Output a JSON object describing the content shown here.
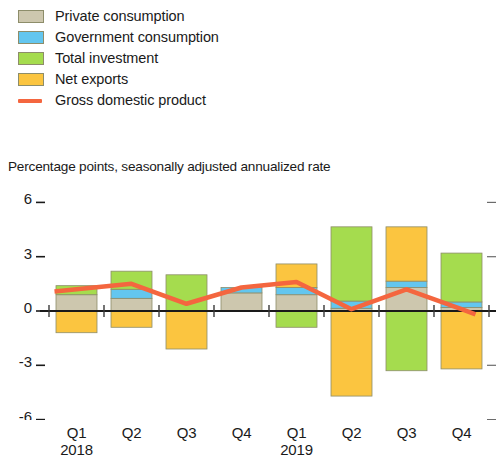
{
  "legend": {
    "items": [
      {
        "label": "Private consumption",
        "type": "swatch",
        "color": "#cdc7ae",
        "icon": "square-swatch-icon"
      },
      {
        "label": "Government consumption",
        "type": "swatch",
        "color": "#63c6ef",
        "icon": "square-swatch-icon"
      },
      {
        "label": "Total investment",
        "type": "swatch",
        "color": "#a5dc4e",
        "icon": "square-swatch-icon"
      },
      {
        "label": "Net exports",
        "type": "swatch",
        "color": "#fbc540",
        "icon": "square-swatch-icon"
      },
      {
        "label": "Gross domestic product",
        "type": "line",
        "color": "#f4663f",
        "icon": "line-swatch-icon"
      }
    ]
  },
  "subtitle": "Percentage points, seasonally adjusted annualized rate",
  "chart_data": {
    "type": "bar",
    "subtype": "stacked-bar-with-line",
    "title": "",
    "subtitle": "Percentage points, seasonally adjusted annualized rate",
    "xlabel": "",
    "ylabel": "",
    "ylim": [
      -6,
      6
    ],
    "yticks": [
      6,
      3,
      0,
      -3,
      -6
    ],
    "ytick_labels": [
      "6",
      "3",
      "0",
      "-3",
      "-6"
    ],
    "grid": false,
    "legend_position": "top-left",
    "categories": [
      "Q1",
      "Q2",
      "Q3",
      "Q4",
      "Q1",
      "Q2",
      "Q3",
      "Q4"
    ],
    "category_groups": [
      {
        "label": "2018",
        "start": 0
      },
      {
        "label": "2019",
        "start": 4
      }
    ],
    "series": [
      {
        "name": "Private consumption",
        "color": "#cdc7ae",
        "values": [
          0.9,
          0.7,
          0.0,
          1.0,
          0.9,
          0.15,
          1.3,
          0.2
        ]
      },
      {
        "name": "Government consumption",
        "color": "#63c6ef",
        "values": [
          0.0,
          0.5,
          0.0,
          0.3,
          0.4,
          0.4,
          0.35,
          0.3
        ]
      },
      {
        "name": "Total investment",
        "color": "#a5dc4e",
        "values": [
          0.5,
          1.0,
          2.0,
          0.0,
          -0.9,
          4.1,
          -3.3,
          2.7
        ]
      },
      {
        "name": "Net exports",
        "color": "#fbc540",
        "values": [
          -1.2,
          -0.9,
          -2.1,
          0.0,
          1.3,
          -4.7,
          3.0,
          -3.2
        ]
      }
    ],
    "line_series": {
      "name": "Gross domestic product",
      "color": "#f4663f",
      "values": [
        1.2,
        1.5,
        0.4,
        1.3,
        1.6,
        0.1,
        1.2,
        0.1
      ]
    }
  },
  "axis": {
    "quarters": [
      "Q1",
      "Q2",
      "Q3",
      "Q4",
      "Q1",
      "Q2",
      "Q3",
      "Q4"
    ],
    "years": [
      "2018",
      "",
      "",
      "",
      "2019",
      "",
      "",
      ""
    ]
  }
}
